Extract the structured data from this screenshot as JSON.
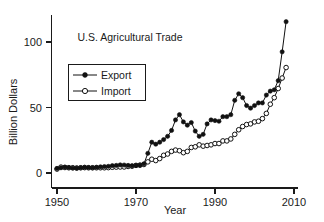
{
  "chart_data": {
    "type": "line",
    "title": "U.S. Agricultural Trade",
    "xlabel": "Year",
    "ylabel": "Billion Dollars",
    "xlim": [
      1947,
      2011
    ],
    "ylim": [
      -5,
      128
    ],
    "xticks": [
      1950,
      1970,
      1990,
      2010
    ],
    "xtick_labels": [
      "1950",
      "1970",
      "1990",
      "2010"
    ],
    "yticks": [
      0,
      50,
      100
    ],
    "ytick_labels": [
      "0",
      "50",
      "100"
    ],
    "grid": false,
    "legend_position": "upper-left-inside",
    "x": [
      1950,
      1951,
      1952,
      1953,
      1954,
      1955,
      1956,
      1957,
      1958,
      1959,
      1960,
      1961,
      1962,
      1963,
      1964,
      1965,
      1966,
      1967,
      1968,
      1969,
      1970,
      1971,
      1972,
      1973,
      1974,
      1975,
      1976,
      1977,
      1978,
      1979,
      1980,
      1981,
      1982,
      1983,
      1984,
      1985,
      1986,
      1987,
      1988,
      1989,
      1990,
      1991,
      1992,
      1993,
      1994,
      1995,
      1996,
      1997,
      1998,
      1999,
      2000,
      2001,
      2002,
      2003,
      2004,
      2005,
      2006,
      2007,
      2008
    ],
    "series": [
      {
        "name": "Export",
        "marker": "filled-circle",
        "values": [
          3.5,
          4.0,
          4.5,
          4.2,
          3.8,
          3.7,
          4.0,
          4.4,
          4.2,
          4.0,
          4.4,
          4.7,
          4.9,
          5.1,
          5.6,
          5.8,
          6.2,
          6.1,
          5.8,
          5.5,
          5.8,
          6.0,
          7.0,
          15.0,
          23.5,
          22.0,
          23.5,
          25.5,
          28.0,
          32.5,
          40.5,
          44.5,
          39.0,
          36.5,
          38.5,
          32.0,
          28.0,
          29.5,
          37.5,
          40.5,
          40.0,
          39.5,
          43.0,
          43.0,
          44.5,
          55.5,
          60.5,
          57.5,
          51.5,
          49.5,
          51.5,
          53.5,
          53.5,
          59.5,
          62.5,
          63.5,
          70.5,
          92.5,
          115.5
        ]
      },
      {
        "name": "Import",
        "marker": "open-circle",
        "values": [
          3.0,
          4.5,
          4.2,
          4.0,
          4.0,
          3.8,
          4.0,
          4.1,
          4.0,
          4.0,
          4.0,
          4.0,
          4.0,
          4.1,
          4.4,
          4.5,
          4.6,
          4.6,
          5.0,
          5.2,
          5.8,
          6.0,
          6.5,
          8.5,
          10.5,
          9.5,
          11.0,
          13.5,
          14.5,
          16.5,
          17.5,
          17.0,
          15.5,
          16.5,
          19.5,
          20.0,
          21.5,
          20.5,
          21.0,
          21.5,
          22.5,
          22.5,
          24.5,
          24.5,
          26.0,
          29.5,
          33.0,
          35.5,
          37.0,
          37.5,
          39.0,
          39.5,
          41.5,
          45.5,
          52.5,
          57.5,
          64.5,
          72.5,
          80.5
        ]
      }
    ]
  },
  "axis": {
    "y_title": "Billion Dollars",
    "x_title": "Year"
  },
  "title": {
    "text": "U.S. Agricultural Trade"
  },
  "legend": {
    "entries": [
      {
        "label": "Export"
      },
      {
        "label": "Import"
      }
    ]
  }
}
